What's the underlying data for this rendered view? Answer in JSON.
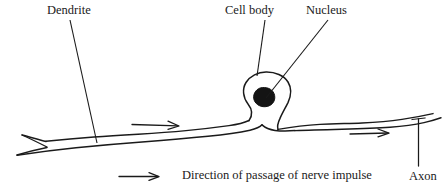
{
  "diagram": {
    "title_labels": {
      "dendrite": "Dendrite",
      "cell_body": "Cell body",
      "nucleus": "Nucleus",
      "axon": "Axon"
    },
    "caption": "Direction of passage of nerve impulse",
    "colors": {
      "ink": "#1a1a1a",
      "background": "#ffffff",
      "nucleus_fill": "#141414"
    },
    "parts": [
      {
        "name": "dendrite",
        "label": "Dendrite"
      },
      {
        "name": "cell-body",
        "label": "Cell body"
      },
      {
        "name": "nucleus",
        "label": "Nucleus"
      },
      {
        "name": "axon",
        "label": "Axon"
      }
    ],
    "impulse_arrows": [
      {
        "name": "axon-arrow-left",
        "direction": "right"
      },
      {
        "name": "axon-arrow-right",
        "direction": "right"
      },
      {
        "name": "legend-arrow",
        "direction": "right"
      }
    ]
  }
}
